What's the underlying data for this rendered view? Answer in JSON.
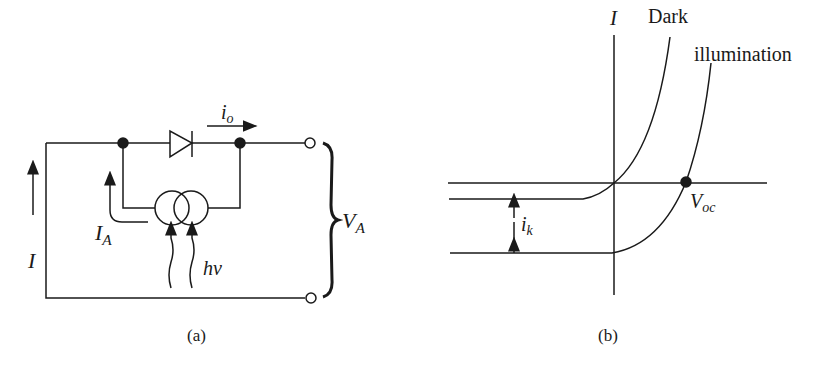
{
  "figure": {
    "panel_a": {
      "caption": "(a)",
      "labels": {
        "current_I": "I",
        "current_io_main": "i",
        "current_io_sub": "o",
        "current_IA_main": "I",
        "current_IA_sub": "A",
        "photon": "hν",
        "voltage_main": "V",
        "voltage_sub": "A"
      },
      "components": [
        "diode",
        "current-source",
        "node",
        "node",
        "terminal",
        "terminal"
      ]
    },
    "panel_b": {
      "caption": "(b)",
      "labels": {
        "axis_I": "I",
        "curve_dark": "Dark",
        "curve_illumination": "illumination",
        "Voc_main": "V",
        "Voc_sub": "oc",
        "ik_main": "i",
        "ik_sub": "k"
      }
    },
    "colors": {
      "ink": "#1a1a1a",
      "background": "#ffffff"
    }
  }
}
